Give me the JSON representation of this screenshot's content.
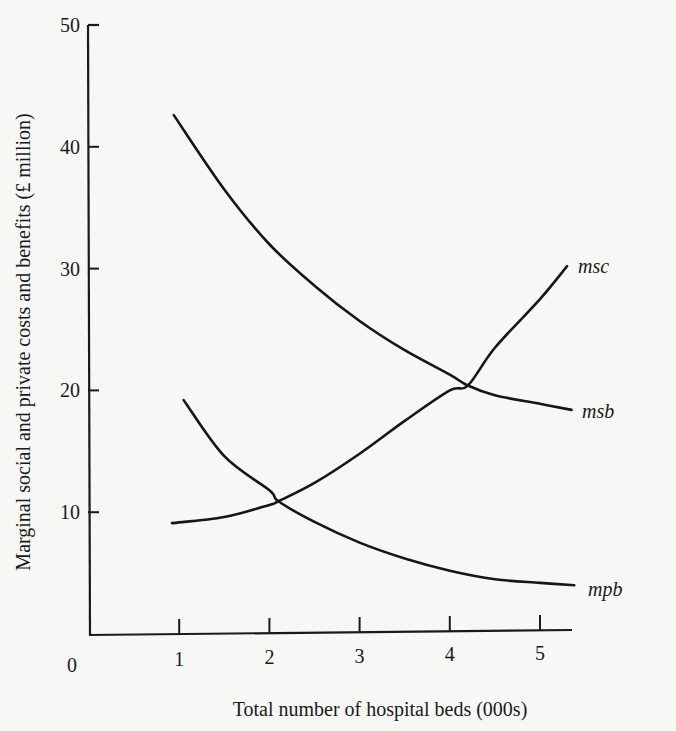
{
  "chart_data": {
    "type": "line",
    "title": "",
    "xlabel": "Total number of hospital beds (000s)",
    "ylabel": "Marginal social and private costs and benefits (£ million)",
    "xlim": [
      0,
      6
    ],
    "ylim": [
      0,
      50
    ],
    "x_ticks": [
      "0",
      "1",
      "2",
      "3",
      "4",
      "5"
    ],
    "y_ticks": [
      "0",
      "10",
      "20",
      "30",
      "40",
      "50"
    ],
    "grid": false,
    "legend": "inline labels at curve ends",
    "series": [
      {
        "name": "msb",
        "x": [
          0.94,
          1.5,
          2.0,
          2.5,
          3.0,
          3.5,
          4.0,
          4.2,
          4.5,
          5.0,
          5.35
        ],
        "y": [
          42.6,
          36.5,
          32.0,
          28.6,
          25.7,
          23.3,
          21.3,
          20.4,
          19.6,
          18.9,
          18.4
        ]
      },
      {
        "name": "msc",
        "x": [
          0.92,
          1.5,
          2.0,
          2.1,
          2.5,
          3.0,
          3.5,
          4.0,
          4.2,
          4.5,
          5.0,
          5.3
        ],
        "y": [
          9.1,
          9.6,
          10.6,
          10.9,
          12.4,
          14.8,
          17.5,
          20.0,
          20.4,
          23.5,
          27.5,
          30.2
        ]
      },
      {
        "name": "mpb",
        "x": [
          1.05,
          1.5,
          2.0,
          2.1,
          2.5,
          3.0,
          3.5,
          4.0,
          4.5,
          5.0,
          5.38
        ],
        "y": [
          19.2,
          14.6,
          11.8,
          10.9,
          9.2,
          7.5,
          6.2,
          5.2,
          4.5,
          4.2,
          4.0
        ]
      }
    ],
    "intersections": [
      {
        "curves": [
          "msb",
          "msc"
        ],
        "x": 4.2,
        "y": 20.4
      },
      {
        "curves": [
          "msc",
          "mpb"
        ],
        "x": 2.1,
        "y": 10.9
      }
    ]
  },
  "labels": {
    "msb": "msb",
    "msc": "msc",
    "mpb": "mpb"
  }
}
